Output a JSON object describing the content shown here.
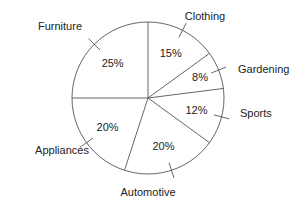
{
  "chart_data": {
    "type": "pie",
    "title": "",
    "categories": [
      "Clothing",
      "Gardening",
      "Sports",
      "Automotive",
      "Appliances",
      "Furniture"
    ],
    "values": [
      15,
      8,
      12,
      20,
      20,
      25
    ],
    "value_labels": [
      "15%",
      "8%",
      "12%",
      "20%",
      "20%",
      "25%"
    ],
    "unit": "%",
    "start_angle_deg": 90,
    "direction": "clockwise",
    "legend": "none (external labels with tick marks)"
  },
  "style": {
    "stroke": "#555555",
    "fill": "#ffffff",
    "text": "#222222"
  }
}
